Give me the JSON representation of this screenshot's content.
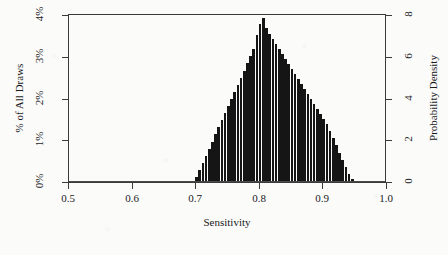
{
  "chart_data": {
    "type": "bar",
    "title": "",
    "subtitle": "",
    "xlabel": "Sensitivity",
    "ylabel": "% of All Draws",
    "ylabel_secondary": "Probability Density",
    "xlim": [
      0.5,
      1.0
    ],
    "ylim": [
      0,
      4
    ],
    "ylim_secondary": [
      0,
      8
    ],
    "grid": false,
    "legend": null,
    "x_ticks": [
      0.5,
      0.6,
      0.7,
      0.8,
      0.9,
      1.0
    ],
    "x_tick_labels": [
      "0.5",
      "0.6",
      "0.7",
      "0.8",
      "0.9",
      "1.0"
    ],
    "y_ticks": [
      0,
      1,
      2,
      3,
      4
    ],
    "y_tick_labels": [
      "0%",
      "1%",
      "2%",
      "3%",
      "4%"
    ],
    "y_ticks_secondary": [
      0,
      2,
      4,
      6,
      8
    ],
    "y_tick_labels_secondary": [
      "0",
      "2",
      "4",
      "6",
      "8"
    ],
    "bar_color": "#151515",
    "axis_color": "#3a3a3a",
    "bin_width": 0.005,
    "note": "Triangular posterior histogram of sensitivity draws; support approx 0.70-0.95, mode approx 0.805",
    "x": [
      0.7,
      0.705,
      0.71,
      0.715,
      0.72,
      0.725,
      0.73,
      0.735,
      0.74,
      0.745,
      0.75,
      0.755,
      0.76,
      0.765,
      0.77,
      0.775,
      0.78,
      0.785,
      0.79,
      0.795,
      0.8,
      0.805,
      0.81,
      0.815,
      0.82,
      0.825,
      0.83,
      0.835,
      0.84,
      0.845,
      0.85,
      0.855,
      0.86,
      0.865,
      0.87,
      0.875,
      0.88,
      0.885,
      0.89,
      0.895,
      0.9,
      0.905,
      0.91,
      0.915,
      0.92,
      0.925,
      0.93,
      0.935,
      0.94,
      0.945
    ],
    "values": [
      0.12,
      0.28,
      0.46,
      0.63,
      0.8,
      0.97,
      1.14,
      1.31,
      1.48,
      1.65,
      1.82,
      1.99,
      2.16,
      2.33,
      2.5,
      2.67,
      2.84,
      3.01,
      3.18,
      3.52,
      3.78,
      3.92,
      3.7,
      3.55,
      3.42,
      3.3,
      3.18,
      3.06,
      2.94,
      2.82,
      2.7,
      2.58,
      2.46,
      2.34,
      2.22,
      2.1,
      1.98,
      1.86,
      1.74,
      1.62,
      1.5,
      1.38,
      1.22,
      1.05,
      0.88,
      0.7,
      0.52,
      0.36,
      0.2,
      0.08
    ],
    "values_secondary_scale": "percent values map 1:2 onto probability density (4% = 8)"
  },
  "axes": {
    "left_title": "% of All Draws",
    "right_title": "Probability Density",
    "bottom_title": "Sensitivity"
  }
}
